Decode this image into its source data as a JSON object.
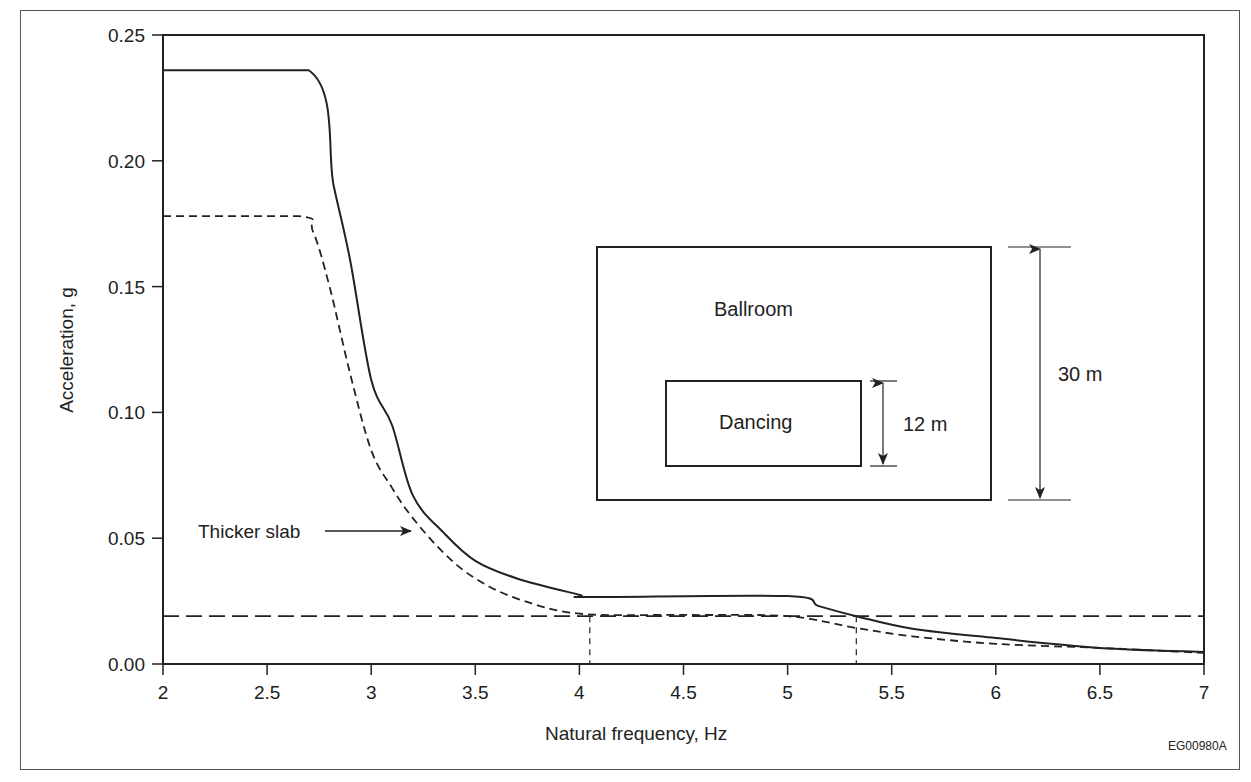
{
  "chart_data": {
    "type": "line",
    "title": "",
    "xlabel": "Natural frequency, Hz",
    "ylabel": "Acceleration, g",
    "xlim": [
      2,
      7
    ],
    "ylim": [
      0,
      0.25
    ],
    "x_ticks": [
      "2",
      "2.5",
      "3",
      "3.5",
      "4",
      "4.5",
      "5",
      "5.5",
      "6",
      "6.5",
      "7"
    ],
    "y_ticks": [
      "0.00",
      "0.05",
      "0.10",
      "0.15",
      "0.20",
      "0.25"
    ],
    "grid": false,
    "series": [
      {
        "name": "Standard slab",
        "style": "solid",
        "x": [
          2.0,
          2.7,
          2.82,
          2.9,
          3.0,
          3.1,
          3.2,
          3.35,
          3.5,
          3.7,
          4.0,
          4.05,
          5.0,
          5.15,
          5.33,
          5.6,
          6.0,
          6.5,
          7.0
        ],
        "values": [
          0.236,
          0.236,
          0.19,
          0.16,
          0.113,
          0.095,
          0.067,
          0.052,
          0.041,
          0.034,
          0.0275,
          0.0266,
          0.027,
          0.023,
          0.019,
          0.014,
          0.0103,
          0.0064,
          0.0048
        ]
      },
      {
        "name": "Thicker slab",
        "style": "dashed",
        "x": [
          2.0,
          2.65,
          2.72,
          2.8,
          2.9,
          3.0,
          3.1,
          3.2,
          3.35,
          3.5,
          3.7,
          4.0,
          4.5,
          5.0,
          5.33,
          5.6,
          6.0,
          6.5,
          7.0
        ],
        "values": [
          0.178,
          0.178,
          0.172,
          0.15,
          0.115,
          0.085,
          0.07,
          0.058,
          0.044,
          0.034,
          0.026,
          0.02,
          0.0195,
          0.019,
          0.0143,
          0.011,
          0.008,
          0.0064,
          0.0044
        ]
      },
      {
        "name": "Acceptance limit",
        "style": "long-dash",
        "x": [
          2.0,
          7.0
        ],
        "values": [
          0.019,
          0.019
        ]
      }
    ],
    "vertical_markers": [
      4.05,
      5.33
    ],
    "annotations": [
      {
        "text": "Thicker slab",
        "points_to": "Thicker slab",
        "x": 3.2,
        "y": 0.053
      }
    ],
    "legend": null
  },
  "inset": {
    "outer_label": "Ballroom",
    "inner_label": "Dancing",
    "inner_dimension": "12 m",
    "outer_dimension": "30 m"
  },
  "figure_code": "EG00980A",
  "colors": {
    "line": "#222222",
    "frame": "#555555",
    "background": "#ffffff"
  }
}
